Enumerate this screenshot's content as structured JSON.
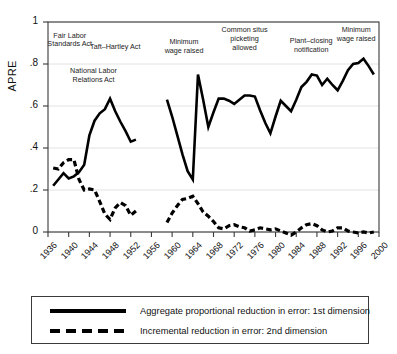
{
  "chart_data": {
    "type": "line",
    "title": "",
    "xlabel": "",
    "ylabel": "APRE",
    "xlim": [
      1936,
      2000
    ],
    "ylim": [
      0,
      1
    ],
    "grid": true,
    "yticks": [
      "0",
      ".2",
      ".4",
      ".6",
      ".8",
      "1"
    ],
    "ytick_values": [
      0,
      0.2,
      0.4,
      0.6,
      0.8,
      1
    ],
    "xticks": [
      "1936",
      "1940",
      "1944",
      "1948",
      "1952",
      "1956",
      "1960",
      "1964",
      "1968",
      "1972",
      "1976",
      "1980",
      "1984",
      "1988",
      "1992",
      "1996",
      "2000"
    ],
    "xtick_values": [
      1936,
      1940,
      1944,
      1948,
      1952,
      1956,
      1960,
      1964,
      1968,
      1972,
      1976,
      1980,
      1984,
      1988,
      1992,
      1996,
      2000
    ],
    "legend_position": "below-plot",
    "series": [
      {
        "name": "Aggregate proportional reduction in error: 1st dimension",
        "style": "solid",
        "color": "#000000",
        "segments": [
          {
            "x": [
              1937,
              1938,
              1939,
              1940,
              1941,
              1942,
              1943,
              1944,
              1945,
              1946,
              1947,
              1948,
              1949,
              1950,
              1951,
              1952,
              1953
            ],
            "y": [
              0.22,
              0.25,
              0.28,
              0.255,
              0.265,
              0.285,
              0.32,
              0.46,
              0.53,
              0.565,
              0.585,
              0.635,
              0.575,
              0.525,
              0.48,
              0.43,
              0.44
            ]
          },
          {
            "x": [
              1959,
              1960,
              1961,
              1962,
              1963,
              1964,
              1965,
              1966,
              1967,
              1968,
              1969,
              1970,
              1971,
              1972,
              1973,
              1974,
              1975,
              1976,
              1977,
              1978,
              1979,
              1980,
              1981,
              1982,
              1983,
              1984,
              1985,
              1986,
              1987,
              1988,
              1989,
              1990,
              1991,
              1992,
              1993,
              1994,
              1995,
              1996,
              1997,
              1998,
              1999
            ],
            "y": [
              0.63,
              0.55,
              0.46,
              0.37,
              0.29,
              0.25,
              0.75,
              0.63,
              0.5,
              0.57,
              0.635,
              0.635,
              0.625,
              0.61,
              0.63,
              0.65,
              0.65,
              0.645,
              0.58,
              0.52,
              0.47,
              0.55,
              0.625,
              0.6,
              0.575,
              0.63,
              0.69,
              0.715,
              0.75,
              0.745,
              0.7,
              0.73,
              0.7,
              0.675,
              0.72,
              0.77,
              0.8,
              0.805,
              0.825,
              0.79,
              0.75
            ]
          }
        ]
      },
      {
        "name": "Incremental reduction in error: 2nd dimension",
        "style": "dashed",
        "color": "#000000",
        "segments": [
          {
            "x": [
              1937,
              1938,
              1939,
              1940,
              1941,
              1942,
              1943,
              1944,
              1945,
              1946,
              1947,
              1948,
              1949,
              1950,
              1951,
              1952,
              1953
            ],
            "y": [
              0.305,
              0.3,
              0.33,
              0.345,
              0.345,
              0.25,
              0.2,
              0.205,
              0.2,
              0.145,
              0.085,
              0.06,
              0.115,
              0.14,
              0.125,
              0.08,
              0.1
            ]
          },
          {
            "x": [
              1959,
              1960,
              1961,
              1962,
              1963,
              1964,
              1965,
              1966,
              1967,
              1968,
              1969,
              1970,
              1971,
              1972,
              1973,
              1974,
              1975,
              1976,
              1977,
              1978,
              1979,
              1980,
              1981,
              1982,
              1983,
              1984,
              1985,
              1986,
              1987,
              1988,
              1989,
              1990,
              1991,
              1992,
              1993,
              1994,
              1995,
              1996,
              1997,
              1998,
              1999
            ],
            "y": [
              0.045,
              0.09,
              0.125,
              0.155,
              0.16,
              0.17,
              0.135,
              0.095,
              0.075,
              0.05,
              0.02,
              0.015,
              0.03,
              0.035,
              0.025,
              0.02,
              0.005,
              0.01,
              0.02,
              0.015,
              0.01,
              0.015,
              0.005,
              -0.005,
              -0.015,
              0.0,
              0.02,
              0.035,
              0.04,
              0.03,
              0.01,
              0.0,
              0.005,
              0.02,
              0.02,
              0.005,
              0.0,
              -0.005,
              0.0,
              -0.005,
              0.0
            ]
          }
        ]
      }
    ],
    "annotations": [
      {
        "text": "Fair Labor\nStandards Act",
        "x": 1940.2,
        "y": 0.93
      },
      {
        "text": "Taft–Hartley Act",
        "x": 1949.0,
        "y": 0.875
      },
      {
        "text": "National Labor\nRelations Act",
        "x": 1944.8,
        "y": 0.76
      },
      {
        "text": "Minimum\nwage raised",
        "x": 1962.3,
        "y": 0.9
      },
      {
        "text": "Common situs\npicketing\nallowed",
        "x": 1974.0,
        "y": 0.955
      },
      {
        "text": "Plant–closing\nnotification",
        "x": 1986.9,
        "y": 0.905
      },
      {
        "text": "Minimum\nwage raised",
        "x": 1995.6,
        "y": 0.955
      }
    ]
  },
  "legend": {
    "items": [
      {
        "label": "Aggregate proportional reduction in error: 1st dimension",
        "style": "solid"
      },
      {
        "label": "Incremental reduction in error: 2nd dimension",
        "style": "dashed"
      }
    ]
  },
  "colors": {
    "line": "#000000",
    "frame": "#3a3a3a",
    "grid": "#e2e2e2",
    "background": "#ffffff"
  }
}
